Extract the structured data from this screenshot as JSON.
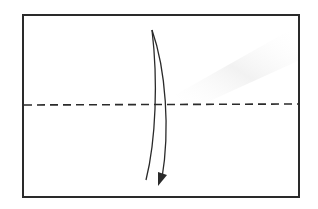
{
  "diagram": {
    "type": "origami-fold-step",
    "colors": {
      "stroke": "#2a2a2a",
      "background": "#ffffff",
      "shadow": "#f0f0f0"
    },
    "elements": {
      "paper": {
        "shape": "rectangle"
      },
      "fold_line": {
        "style": "dashed",
        "orientation": "horizontal"
      },
      "arrow": {
        "direction": "down",
        "curved": true
      }
    }
  }
}
